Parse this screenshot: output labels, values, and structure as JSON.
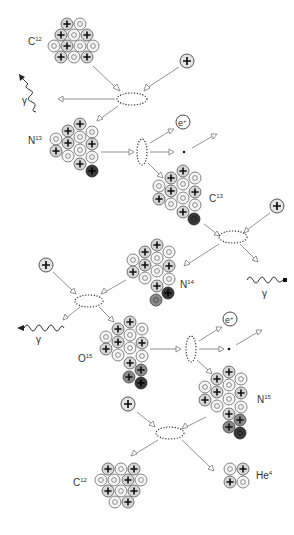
{
  "colors": {
    "proton_fill": "#d6d6d6",
    "neutron_fill": "#f4f4f4",
    "new_proton_fill": "#3a3a3a",
    "new_neutron_fill": "#3a3a3a",
    "recent_fill": "#8a8a8a",
    "stroke": "#555555"
  },
  "labels": {
    "c12_top": "C",
    "c12_top_sup": "12",
    "n13": "N",
    "n13_sup": "13",
    "c13": "C",
    "c13_sup": "13",
    "n14": "N",
    "n14_sup": "14",
    "o15": "O",
    "o15_sup": "15",
    "n15": "N",
    "n15_sup": "15",
    "c12_bottom": "C",
    "c12_bottom_sup": "12",
    "he4": "He",
    "he4_sup": "4",
    "gamma1": "γ",
    "gamma2": "γ",
    "gamma3": "γ",
    "positron1": "e",
    "positron1_sup": "+",
    "positron2": "e",
    "positron2_sup": "+"
  },
  "steps": [
    {
      "reaction": "C12 + p → N13 + γ"
    },
    {
      "reaction": "N13 → C13 + e+ + ν"
    },
    {
      "reaction": "C13 + p → N14 + γ"
    },
    {
      "reaction": "N14 + p → O15 + γ"
    },
    {
      "reaction": "O15 → N15 + e+ + ν"
    },
    {
      "reaction": "N15 + p → C12 + He4"
    }
  ]
}
